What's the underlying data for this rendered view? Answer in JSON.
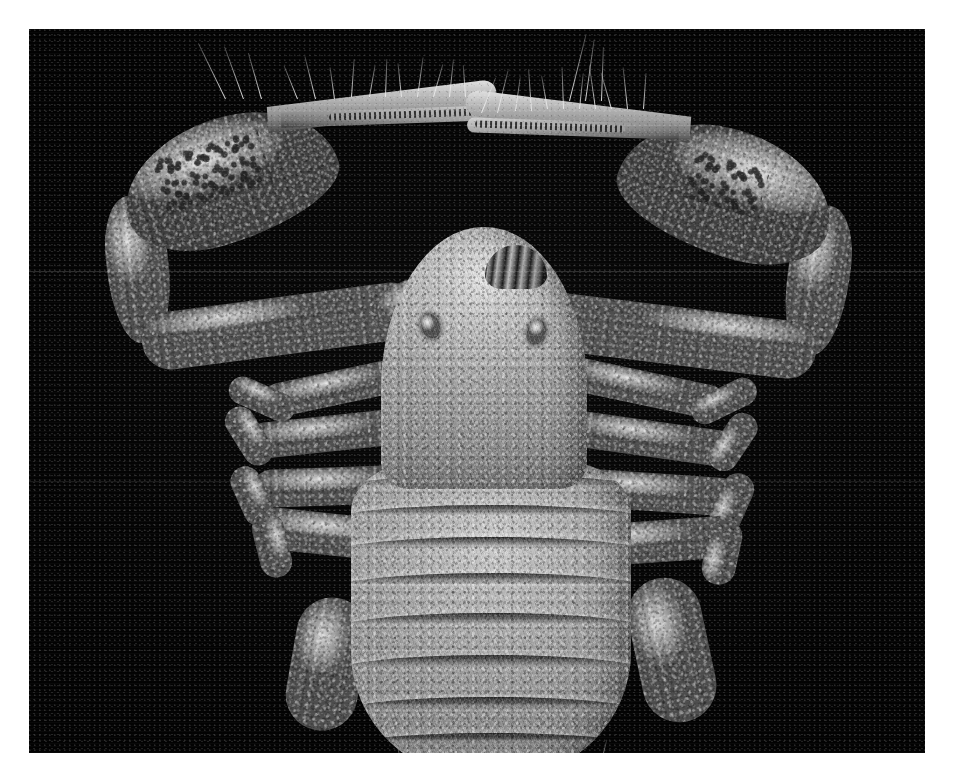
{
  "image": {
    "kind": "sem-micrograph",
    "subject": "pseudoscorpion-dorsal-view",
    "orientation": "dorsal",
    "canvas": {
      "width": 955,
      "height": 776
    },
    "border_color": "#ffffff",
    "plate": {
      "left": 29,
      "top": 29,
      "width": 896,
      "height": 724,
      "background": "#000000"
    },
    "palette": {
      "background": "#000000",
      "cuticle_midtone": "#8a8a8a",
      "cuticle_highlight": "#d8d8d8",
      "cuticle_shadow": "#3d3d3d",
      "seta_highlight": "#ebebeb",
      "border": "#ffffff"
    },
    "artifacts": {
      "scanlines_y": [
        242,
        452
      ],
      "scanline_color": "#ffffff",
      "raster_visible": true,
      "grain_visible": true
    }
  },
  "anatomy": {
    "carapace": {
      "label": "carapace",
      "eyes": [
        {
          "label": "eye-left"
        },
        {
          "label": "eye-right"
        }
      ],
      "chelicerae": {
        "label": "chelicerae"
      }
    },
    "abdomen": {
      "label": "opisthosoma",
      "tergite_count": 9,
      "tergites": [
        {
          "label": "tergite-1",
          "top": 14,
          "height": 15
        },
        {
          "label": "tergite-2",
          "top": 44,
          "height": 15
        },
        {
          "label": "tergite-3",
          "top": 76,
          "height": 16
        },
        {
          "label": "tergite-4",
          "top": 112,
          "height": 16
        },
        {
          "label": "tergite-5",
          "top": 152,
          "height": 17
        },
        {
          "label": "tergite-6",
          "top": 194,
          "height": 17
        },
        {
          "label": "tergite-7",
          "top": 236,
          "height": 17
        },
        {
          "label": "tergite-8",
          "top": 272,
          "height": 16
        },
        {
          "label": "tergite-9",
          "top": 300,
          "height": 14
        }
      ]
    },
    "pedipalps": [
      {
        "label": "pedipalp-left",
        "side": "left",
        "segments": [
          {
            "label": "coxa-trochanter"
          },
          {
            "label": "femur"
          },
          {
            "label": "patella"
          },
          {
            "label": "chela-hand"
          },
          {
            "label": "fixed-finger"
          },
          {
            "label": "movable-finger"
          }
        ],
        "features": [
          "granular-cuticle",
          "cracked-patch",
          "marginal-setae",
          "finger-teeth"
        ]
      },
      {
        "label": "pedipalp-right",
        "side": "right",
        "segments": [
          {
            "label": "coxa-trochanter"
          },
          {
            "label": "femur"
          },
          {
            "label": "patella"
          },
          {
            "label": "chela-hand"
          },
          {
            "label": "fixed-finger"
          },
          {
            "label": "movable-finger"
          }
        ],
        "features": [
          "granular-cuticle",
          "cracked-patch",
          "marginal-setae",
          "finger-teeth"
        ]
      }
    ],
    "walking_legs": [
      {
        "label": "leg-left-1",
        "side": "left",
        "index": 1
      },
      {
        "label": "leg-left-2",
        "side": "left",
        "index": 2
      },
      {
        "label": "leg-left-3",
        "side": "left",
        "index": 3
      },
      {
        "label": "leg-left-4",
        "side": "left",
        "index": 4
      },
      {
        "label": "leg-right-1",
        "side": "right",
        "index": 1
      },
      {
        "label": "leg-right-2",
        "side": "right",
        "index": 2
      },
      {
        "label": "leg-right-3",
        "side": "right",
        "index": 3
      },
      {
        "label": "leg-right-4",
        "side": "right",
        "index": 4
      }
    ]
  },
  "overlays": {
    "text_present": false,
    "scale_bar_present": false,
    "labels": []
  }
}
